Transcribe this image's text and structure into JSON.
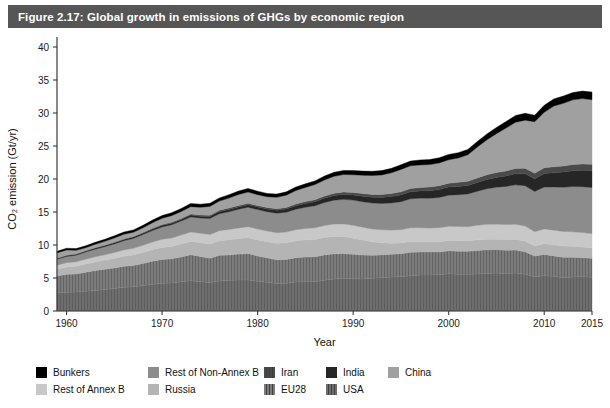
{
  "figure": {
    "title": "Figure 2.17: Global growth in emissions of GHGs by economic region",
    "title_bar_color": "#565656",
    "background_color": "#ffffff"
  },
  "chart_data": {
    "type": "area",
    "stacked": true,
    "title": "Global growth in emissions of GHGs by economic region",
    "xlabel": "Year",
    "ylabel": "CO2 emission (Gt/yr)",
    "ylabel_display": "CO₂ emission (Gt/yr)",
    "xlim": [
      1959,
      2015
    ],
    "ylim": [
      0,
      40
    ],
    "yticks": [
      0,
      5,
      10,
      15,
      20,
      25,
      30,
      35,
      40
    ],
    "xticks": [
      1960,
      1970,
      1980,
      1990,
      2000,
      2010,
      2015
    ],
    "grid": false,
    "legend_position": "bottom",
    "x": [
      1959,
      1960,
      1961,
      1962,
      1963,
      1964,
      1965,
      1966,
      1967,
      1968,
      1969,
      1970,
      1971,
      1972,
      1973,
      1974,
      1975,
      1976,
      1977,
      1978,
      1979,
      1980,
      1981,
      1982,
      1983,
      1984,
      1985,
      1986,
      1987,
      1988,
      1989,
      1990,
      1991,
      1992,
      1993,
      1994,
      1995,
      1996,
      1997,
      1998,
      1999,
      2000,
      2001,
      2002,
      2003,
      2004,
      2005,
      2006,
      2007,
      2008,
      2009,
      2010,
      2011,
      2012,
      2013,
      2014,
      2015
    ],
    "stack_order_bottom_to_top": [
      "USA",
      "EU28",
      "Russia",
      "Rest of Annex B",
      "Rest of Non-Annex B",
      "India",
      "Iran",
      "China",
      "Bunkers"
    ],
    "series": [
      {
        "name": "USA",
        "color": "#6e6e6e",
        "pattern": "vertical-lines",
        "values": [
          2.75,
          2.85,
          2.88,
          3.0,
          3.12,
          3.25,
          3.4,
          3.58,
          3.68,
          3.85,
          4.05,
          4.2,
          4.25,
          4.45,
          4.6,
          4.45,
          4.3,
          4.55,
          4.65,
          4.7,
          4.7,
          4.5,
          4.35,
          4.15,
          4.2,
          4.4,
          4.45,
          4.45,
          4.65,
          4.85,
          4.95,
          4.9,
          4.85,
          4.95,
          5.05,
          5.15,
          5.2,
          5.35,
          5.45,
          5.45,
          5.5,
          5.65,
          5.55,
          5.55,
          5.6,
          5.7,
          5.75,
          5.65,
          5.75,
          5.55,
          5.2,
          5.35,
          5.25,
          5.05,
          5.15,
          5.2,
          5.1
        ]
      },
      {
        "name": "EU28",
        "color": "#7c7c7c",
        "pattern": "vertical-lines",
        "values": [
          2.55,
          2.7,
          2.72,
          2.88,
          3.0,
          3.08,
          3.12,
          3.2,
          3.22,
          3.35,
          3.5,
          3.62,
          3.65,
          3.75,
          3.92,
          3.82,
          3.7,
          3.88,
          3.85,
          3.92,
          4.0,
          3.85,
          3.7,
          3.62,
          3.62,
          3.68,
          3.75,
          3.78,
          3.85,
          3.82,
          3.75,
          3.68,
          3.62,
          3.5,
          3.45,
          3.45,
          3.48,
          3.55,
          3.48,
          3.52,
          3.45,
          3.48,
          3.52,
          3.5,
          3.58,
          3.58,
          3.55,
          3.55,
          3.48,
          3.42,
          3.12,
          3.22,
          3.1,
          3.08,
          3.0,
          2.88,
          2.9
        ]
      },
      {
        "name": "Russia",
        "color": "#b4b4b4",
        "pattern": "solid",
        "values": [
          1.05,
          1.12,
          1.18,
          1.25,
          1.32,
          1.38,
          1.45,
          1.52,
          1.6,
          1.68,
          1.75,
          1.82,
          1.88,
          1.95,
          2.02,
          2.08,
          2.15,
          2.22,
          2.28,
          2.35,
          2.4,
          2.42,
          2.45,
          2.48,
          2.52,
          2.55,
          2.58,
          2.62,
          2.65,
          2.62,
          2.58,
          2.45,
          2.3,
          2.05,
          1.85,
          1.68,
          1.62,
          1.62,
          1.55,
          1.52,
          1.55,
          1.55,
          1.58,
          1.55,
          1.6,
          1.6,
          1.58,
          1.62,
          1.6,
          1.62,
          1.52,
          1.62,
          1.68,
          1.7,
          1.65,
          1.62,
          1.58
        ]
      },
      {
        "name": "Rest of Annex B",
        "color": "#c8c8c8",
        "pattern": "solid",
        "values": [
          0.6,
          0.65,
          0.68,
          0.72,
          0.78,
          0.82,
          0.88,
          0.95,
          1.0,
          1.08,
          1.15,
          1.22,
          1.28,
          1.35,
          1.42,
          1.42,
          1.45,
          1.52,
          1.58,
          1.62,
          1.68,
          1.65,
          1.62,
          1.62,
          1.62,
          1.68,
          1.72,
          1.75,
          1.8,
          1.88,
          1.92,
          1.95,
          1.92,
          1.92,
          1.95,
          1.98,
          2.02,
          2.08,
          2.12,
          2.08,
          2.12,
          2.15,
          2.15,
          2.18,
          2.22,
          2.25,
          2.28,
          2.28,
          2.3,
          2.28,
          2.18,
          2.25,
          2.22,
          2.22,
          2.2,
          2.18,
          2.15
        ]
      },
      {
        "name": "Rest of Non-Annex B",
        "color": "#8c8c8c",
        "pattern": "solid",
        "values": [
          0.9,
          0.95,
          1.0,
          1.08,
          1.15,
          1.22,
          1.32,
          1.4,
          1.5,
          1.62,
          1.75,
          1.88,
          2.0,
          2.12,
          2.3,
          2.32,
          2.42,
          2.58,
          2.68,
          2.82,
          2.95,
          2.95,
          2.92,
          2.95,
          3.0,
          3.12,
          3.22,
          3.35,
          3.48,
          3.62,
          3.72,
          3.82,
          3.88,
          3.95,
          4.0,
          4.12,
          4.25,
          4.4,
          4.5,
          4.52,
          4.58,
          4.72,
          4.82,
          4.95,
          5.15,
          5.4,
          5.6,
          5.78,
          5.98,
          6.12,
          6.08,
          6.35,
          6.55,
          6.7,
          6.85,
          6.95,
          6.98
        ]
      },
      {
        "name": "India",
        "color": "#262626",
        "pattern": "solid",
        "values": [
          0.12,
          0.13,
          0.14,
          0.15,
          0.16,
          0.17,
          0.18,
          0.19,
          0.2,
          0.21,
          0.23,
          0.24,
          0.25,
          0.26,
          0.27,
          0.28,
          0.3,
          0.32,
          0.34,
          0.36,
          0.38,
          0.4,
          0.43,
          0.45,
          0.48,
          0.52,
          0.56,
          0.6,
          0.65,
          0.7,
          0.75,
          0.78,
          0.82,
          0.86,
          0.9,
          0.95,
          1.0,
          1.05,
          1.1,
          1.14,
          1.2,
          1.22,
          1.25,
          1.28,
          1.32,
          1.4,
          1.48,
          1.58,
          1.7,
          1.8,
          1.92,
          2.05,
          2.15,
          2.3,
          2.4,
          2.5,
          2.55
        ]
      },
      {
        "name": "Iran",
        "color": "#4a4a4a",
        "pattern": "solid",
        "values": [
          0.03,
          0.03,
          0.04,
          0.04,
          0.05,
          0.05,
          0.06,
          0.07,
          0.08,
          0.09,
          0.1,
          0.11,
          0.12,
          0.14,
          0.16,
          0.17,
          0.18,
          0.2,
          0.22,
          0.23,
          0.22,
          0.21,
          0.22,
          0.24,
          0.26,
          0.28,
          0.3,
          0.32,
          0.33,
          0.34,
          0.36,
          0.38,
          0.4,
          0.42,
          0.44,
          0.46,
          0.48,
          0.5,
          0.52,
          0.55,
          0.58,
          0.6,
          0.62,
          0.65,
          0.68,
          0.7,
          0.73,
          0.76,
          0.79,
          0.82,
          0.85,
          0.88,
          0.9,
          0.92,
          0.94,
          0.95,
          0.96
        ]
      },
      {
        "name": "China",
        "color": "#a0a0a0",
        "pattern": "solid",
        "values": [
          0.8,
          0.82,
          0.55,
          0.48,
          0.52,
          0.58,
          0.65,
          0.72,
          0.65,
          0.72,
          0.85,
          0.95,
          1.02,
          1.05,
          1.12,
          1.18,
          1.35,
          1.38,
          1.52,
          1.65,
          1.7,
          1.65,
          1.62,
          1.72,
          1.85,
          2.02,
          2.15,
          2.28,
          2.45,
          2.58,
          2.65,
          2.68,
          2.78,
          2.88,
          2.98,
          3.15,
          3.4,
          3.45,
          3.42,
          3.4,
          3.45,
          3.55,
          3.7,
          4.0,
          4.7,
          5.3,
          5.9,
          6.5,
          7.0,
          7.3,
          7.8,
          8.4,
          9.2,
          9.5,
          9.8,
          9.9,
          9.8
        ]
      },
      {
        "name": "Bunkers",
        "color": "#000000",
        "pattern": "solid",
        "values": [
          0.25,
          0.26,
          0.27,
          0.28,
          0.3,
          0.31,
          0.33,
          0.34,
          0.36,
          0.38,
          0.4,
          0.42,
          0.44,
          0.46,
          0.48,
          0.47,
          0.46,
          0.48,
          0.5,
          0.52,
          0.54,
          0.52,
          0.5,
          0.49,
          0.5,
          0.52,
          0.54,
          0.56,
          0.58,
          0.6,
          0.62,
          0.64,
          0.63,
          0.64,
          0.65,
          0.67,
          0.7,
          0.72,
          0.75,
          0.76,
          0.78,
          0.8,
          0.8,
          0.82,
          0.85,
          0.9,
          0.94,
          0.98,
          1.02,
          1.05,
          1.0,
          1.05,
          1.08,
          1.1,
          1.12,
          1.14,
          1.15
        ]
      }
    ]
  },
  "legend": {
    "rows": [
      [
        {
          "label": "Bunkers",
          "color": "#000000",
          "pattern": "solid"
        },
        {
          "label": "Rest of Non-Annex B",
          "color": "#8c8c8c",
          "pattern": "solid"
        },
        {
          "label": "Iran",
          "color": "#4a4a4a",
          "pattern": "vertical-lines"
        },
        {
          "label": "India",
          "color": "#262626",
          "pattern": "solid"
        },
        {
          "label": "China",
          "color": "#a0a0a0",
          "pattern": "solid"
        }
      ],
      [
        {
          "label": "Rest of Annex B",
          "color": "#c8c8c8",
          "pattern": "solid"
        },
        {
          "label": "Russia",
          "color": "#b4b4b4",
          "pattern": "solid"
        },
        {
          "label": "EU28",
          "color": "#7c7c7c",
          "pattern": "vertical-lines"
        },
        {
          "label": "USA",
          "color": "#6e6e6e",
          "pattern": "vertical-lines"
        },
        {
          "label": "",
          "color": "",
          "pattern": "none"
        }
      ]
    ],
    "column_offsets": [
      0,
      112,
      228,
      290,
      352
    ]
  }
}
